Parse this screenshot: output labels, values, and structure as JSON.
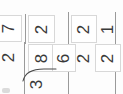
{
  "page": {
    "kind": "long-division-worksheet-scan",
    "orientation": "rotated-90",
    "background_color": "#fdfdfd",
    "ink_color": "#3a3a3a",
    "rule_color": "#9a9a9a",
    "cell_border_color": "#d8d8d8"
  },
  "problems": [
    {
      "id": "problem-1",
      "divisor": "",
      "quotient_digits": [
        "7"
      ],
      "dividend_digits": [
        "2"
      ]
    },
    {
      "id": "problem-2",
      "divisor": "3",
      "quotient_digits": [
        "2"
      ],
      "dividend_digits": [
        "8",
        "6"
      ]
    },
    {
      "id": "problem-3",
      "divisor": "",
      "quotient_digits": [
        "2"
      ],
      "dividend_digits": [
        "2"
      ]
    },
    {
      "id": "problem-4",
      "divisor": "",
      "quotient_digits": [
        "1"
      ],
      "dividend_digits": [
        "2"
      ]
    }
  ],
  "cells": [
    {
      "name": "cell-quotient-7",
      "value": "7"
    },
    {
      "name": "cell-dividend-2a",
      "value": "2"
    },
    {
      "name": "cell-quotient-2b",
      "value": "2"
    },
    {
      "name": "cell-dividend-8",
      "value": "8"
    },
    {
      "name": "cell-dividend-6",
      "value": "6"
    },
    {
      "name": "cell-divisor-3",
      "value": "3"
    },
    {
      "name": "cell-quotient-2c",
      "value": "2"
    },
    {
      "name": "cell-dividend-2d",
      "value": "2"
    },
    {
      "name": "cell-quotient-1",
      "value": "1"
    },
    {
      "name": "cell-dividend-2e",
      "value": "2"
    }
  ]
}
